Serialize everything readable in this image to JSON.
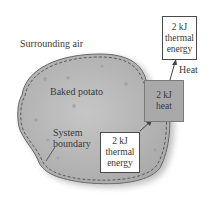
{
  "diagram": {
    "surroundings_label": "Surrounding air",
    "system_label": "Baked potato",
    "boundary_label": [
      "System",
      "boundary"
    ],
    "heat_label": "Heat",
    "boxes": {
      "inside_energy": {
        "lines": [
          "2 kJ",
          "thermal",
          "energy"
        ]
      },
      "heat_transfer": {
        "lines": [
          "2 kJ",
          "heat"
        ]
      },
      "outside_energy": {
        "lines": [
          "2 kJ",
          "thermal",
          "energy"
        ]
      }
    },
    "colors": {
      "potato_fill": "#b8b8b8",
      "heat_box_fill": "#a9a9a9",
      "outline": "#555555",
      "background": "#ffffff"
    }
  }
}
